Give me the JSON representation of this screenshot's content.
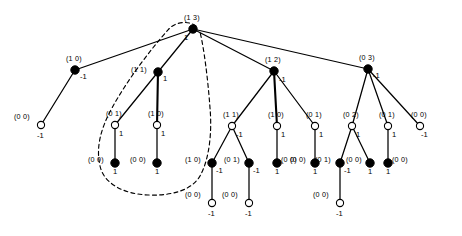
{
  "figure": {
    "type": "tree-diagram",
    "width": 462,
    "height": 236,
    "background": "#ffffff",
    "stroke_color": "#000000",
    "filled_node_fill": "#000000",
    "open_node_fill": "#ffffff",
    "dashed_region_label": "dashed-subtree-boundary"
  },
  "nodes": [
    {
      "id": "n0",
      "pair": "(1 3)",
      "value": "1",
      "shape": "filled",
      "x": 193,
      "y": 29,
      "label_dx": -9,
      "label_dy": -15,
      "value_dx": -9,
      "value_dy": 5
    },
    {
      "id": "n1",
      "pair": "(1 0)",
      "value": "-1",
      "shape": "filled",
      "x": 75,
      "y": 70,
      "label_dx": -9,
      "label_dy": -15,
      "value_dx": 5,
      "value_dy": 3
    },
    {
      "id": "n2",
      "pair": "(1 1)",
      "value": "1",
      "shape": "filled",
      "x": 158,
      "y": 72,
      "label_dx": -27,
      "label_dy": -6,
      "value_dx": 5,
      "value_dy": 3
    },
    {
      "id": "n3",
      "pair": "(1 2)",
      "value": "-1",
      "shape": "filled",
      "x": 274,
      "y": 71,
      "label_dx": -9,
      "label_dy": -15,
      "value_dx": 5,
      "value_dy": 5
    },
    {
      "id": "n4",
      "pair": "(0 3)",
      "value": "-1",
      "shape": "filled",
      "x": 368,
      "y": 69,
      "label_dx": -9,
      "label_dy": -15,
      "value_dx": 5,
      "value_dy": 3
    },
    {
      "id": "n5",
      "pair": "(0 0)",
      "value": "-1",
      "shape": "open",
      "x": 41,
      "y": 125,
      "label_dx": -27,
      "label_dy": -12,
      "value_dx": -4,
      "value_dy": 7
    },
    {
      "id": "n6",
      "pair": "(0 1)",
      "value": "1",
      "shape": "open",
      "x": 115,
      "y": 125,
      "label_dx": -9,
      "label_dy": -15,
      "value_dx": 4,
      "value_dy": 5
    },
    {
      "id": "n7",
      "pair": "(1 0)",
      "value": "1",
      "shape": "open",
      "x": 157,
      "y": 125,
      "label_dx": -9,
      "label_dy": -15,
      "value_dx": 4,
      "value_dy": 5
    },
    {
      "id": "n8",
      "pair": "(1 1)",
      "value": "-1",
      "shape": "open",
      "x": 232,
      "y": 126,
      "label_dx": -9,
      "label_dy": -15,
      "value_dx": 4,
      "value_dy": 5
    },
    {
      "id": "n9",
      "pair": "(1 0)",
      "value": "1",
      "shape": "open",
      "x": 277,
      "y": 126,
      "label_dx": -9,
      "label_dy": -15,
      "value_dx": 4,
      "value_dy": 5
    },
    {
      "id": "n10",
      "pair": "(0 1)",
      "value": "1",
      "shape": "open",
      "x": 315,
      "y": 126,
      "label_dx": -9,
      "label_dy": -15,
      "value_dx": 4,
      "value_dy": 5
    },
    {
      "id": "n11",
      "pair": "(0 2)",
      "value": "1",
      "shape": "open",
      "x": 352,
      "y": 126,
      "label_dx": -9,
      "label_dy": -15,
      "value_dx": 4,
      "value_dy": 5
    },
    {
      "id": "n12",
      "pair": "(0 1)",
      "value": "1",
      "shape": "open",
      "x": 388,
      "y": 126,
      "label_dx": -9,
      "label_dy": -15,
      "value_dx": 4,
      "value_dy": 5
    },
    {
      "id": "n13",
      "pair": "(0 0)",
      "value": "-1",
      "shape": "open",
      "x": 420,
      "y": 126,
      "label_dx": -9,
      "label_dy": -15,
      "value_dx": 1,
      "value_dy": 5
    },
    {
      "id": "n14",
      "pair": "(0 0)",
      "value": "1",
      "shape": "filled",
      "x": 115,
      "y": 163,
      "label_dx": -27,
      "label_dy": -7,
      "value_dx": -2,
      "value_dy": 5
    },
    {
      "id": "n15",
      "pair": "(0 0)",
      "value": "1",
      "shape": "filled",
      "x": 157,
      "y": 163,
      "label_dx": -27,
      "label_dy": -7,
      "value_dx": -2,
      "value_dy": 5
    },
    {
      "id": "n16",
      "pair": "(1 0)",
      "value": "-1",
      "shape": "filled",
      "x": 212,
      "y": 163,
      "label_dx": -27,
      "label_dy": -7,
      "value_dx": 4,
      "value_dy": 4
    },
    {
      "id": "n17",
      "pair": "(0 1)",
      "value": "-1",
      "shape": "filled",
      "x": 249,
      "y": 163,
      "label_dx": -25,
      "label_dy": -7,
      "value_dx": 4,
      "value_dy": 4
    },
    {
      "id": "n18",
      "pair": "(0 0)",
      "value": "1",
      "shape": "filled",
      "x": 277,
      "y": 163,
      "label_dx": 4,
      "label_dy": -7,
      "value_dx": -2,
      "value_dy": 5
    },
    {
      "id": "n19",
      "pair": "(0 0)",
      "value": "1",
      "shape": "filled",
      "x": 315,
      "y": 163,
      "label_dx": -25,
      "label_dy": -7,
      "value_dx": -2,
      "value_dy": 5
    },
    {
      "id": "n20",
      "pair": "(0 1)",
      "value": "-1",
      "shape": "filled",
      "x": 340,
      "y": 163,
      "label_dx": -25,
      "label_dy": -7,
      "value_dx": 4,
      "value_dy": 4
    },
    {
      "id": "n21",
      "pair": "(0 0)",
      "value": "1",
      "shape": "filled",
      "x": 370,
      "y": 163,
      "label_dx": -24,
      "label_dy": -7,
      "value_dx": -2,
      "value_dy": 5
    },
    {
      "id": "n22",
      "pair": "(0 0)",
      "value": "1",
      "shape": "filled",
      "x": 388,
      "y": 163,
      "label_dx": 4,
      "label_dy": -7,
      "value_dx": -2,
      "value_dy": 5
    },
    {
      "id": "n23",
      "pair": "(0 0)",
      "value": "-1",
      "shape": "open",
      "x": 212,
      "y": 203,
      "label_dx": -27,
      "label_dy": -12,
      "value_dx": -4,
      "value_dy": 7
    },
    {
      "id": "n24",
      "pair": "(0 0)",
      "value": "-1",
      "shape": "open",
      "x": 249,
      "y": 203,
      "label_dx": -27,
      "label_dy": -12,
      "value_dx": -4,
      "value_dy": 7
    },
    {
      "id": "n25",
      "pair": "(0 0)",
      "value": "-1",
      "shape": "open",
      "x": 340,
      "y": 203,
      "label_dx": -27,
      "label_dy": -12,
      "value_dx": -4,
      "value_dy": 7
    }
  ],
  "edges": [
    {
      "from": "n0",
      "to": "n1",
      "weight": "thin"
    },
    {
      "from": "n0",
      "to": "n2",
      "weight": "thin"
    },
    {
      "from": "n0",
      "to": "n3",
      "weight": "thin"
    },
    {
      "from": "n0",
      "to": "n4",
      "weight": "thin"
    },
    {
      "from": "n1",
      "to": "n5",
      "weight": "thin"
    },
    {
      "from": "n2",
      "to": "n6",
      "weight": "thin"
    },
    {
      "from": "n2",
      "to": "n7",
      "weight": "thick"
    },
    {
      "from": "n3",
      "to": "n8",
      "weight": "thin"
    },
    {
      "from": "n3",
      "to": "n9",
      "weight": "thick"
    },
    {
      "from": "n3",
      "to": "n10",
      "weight": "thin"
    },
    {
      "from": "n4",
      "to": "n11",
      "weight": "thin"
    },
    {
      "from": "n4",
      "to": "n12",
      "weight": "thin"
    },
    {
      "from": "n4",
      "to": "n13",
      "weight": "thin"
    },
    {
      "from": "n6",
      "to": "n14",
      "weight": "thin"
    },
    {
      "from": "n7",
      "to": "n15",
      "weight": "thin"
    },
    {
      "from": "n8",
      "to": "n16",
      "weight": "thin"
    },
    {
      "from": "n8",
      "to": "n17",
      "weight": "thin"
    },
    {
      "from": "n9",
      "to": "n18",
      "weight": "thin"
    },
    {
      "from": "n10",
      "to": "n19",
      "weight": "thin"
    },
    {
      "from": "n11",
      "to": "n20",
      "weight": "thin"
    },
    {
      "from": "n11",
      "to": "n21",
      "weight": "thin"
    },
    {
      "from": "n12",
      "to": "n22",
      "weight": "thin"
    },
    {
      "from": "n16",
      "to": "n23",
      "weight": "thin"
    },
    {
      "from": "n17",
      "to": "n24",
      "weight": "thin"
    },
    {
      "from": "n20",
      "to": "n25",
      "weight": "thin"
    }
  ],
  "dashed_region": {
    "name": "highlighted-subtree-outline",
    "path": "M 196 26 C 188 20 174 22 168 30 C 150 50 126 82 112 108 C 100 130 96 148 100 166 C 104 184 124 194 148 195 C 172 196 192 190 200 176 C 210 158 212 130 210 108 C 208 80 204 48 200 32"
  }
}
